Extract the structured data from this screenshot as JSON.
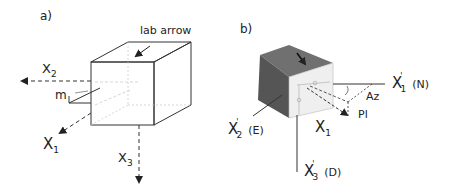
{
  "panel_a": {
    "label": "a)",
    "lab_arrow_label": "lab arrow",
    "axes": {
      "x1": {
        "base": "X",
        "sub": "1"
      },
      "x2": {
        "base": "X",
        "sub": "2"
      },
      "x3": {
        "base": "X",
        "sub": "3"
      }
    },
    "m_label": "m"
  },
  "panel_b": {
    "label": "b)",
    "axes": {
      "x1_prime": {
        "base": "X",
        "prime": "'",
        "sub": "1",
        "suffix": "(N)"
      },
      "x2_prime": {
        "base": "X",
        "prime": "'",
        "sub": "2",
        "suffix": "(E)"
      },
      "x3_prime": {
        "base": "X",
        "prime": "'",
        "sub": "3",
        "suffix": "(D)"
      },
      "x1": {
        "base": "X",
        "sub": "1"
      }
    },
    "angles": {
      "azimuth": "Az",
      "plunge": "Pl"
    }
  },
  "colors": {
    "line": "#333333",
    "dashed": "#444444",
    "faint": "#bbbbbb",
    "cube_b_top": "#6e6e6e",
    "cube_b_left": "#5a5a5a",
    "cube_b_front": "#f0f0f0"
  }
}
